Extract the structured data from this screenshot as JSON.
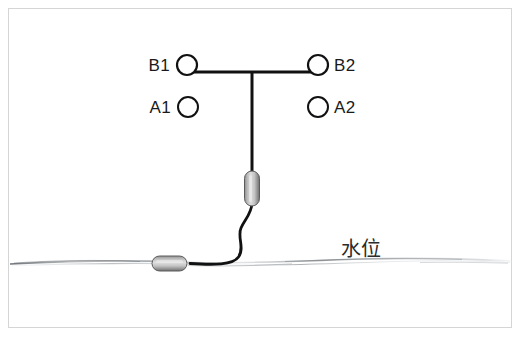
{
  "figure": {
    "frame": {
      "border_color": "#d5d5d5",
      "background": "#ffffff"
    },
    "colors": {
      "line": "#111111",
      "text": "#1a1a1a",
      "waterline": "#6e7176",
      "capsule_light": "#d9d9d9",
      "capsule_mid": "#a8a8a8",
      "capsule_dark": "#6f6f6f"
    },
    "terminals": [
      {
        "id": "B1",
        "label": "B1",
        "label_side": "left",
        "cx": 187,
        "cy": 65,
        "r": 10,
        "connected": true
      },
      {
        "id": "B2",
        "label": "B2",
        "label_side": "right",
        "cx": 318,
        "cy": 65,
        "r": 10,
        "connected": true
      },
      {
        "id": "A1",
        "label": "A1",
        "label_side": "left",
        "cx": 188,
        "cy": 107,
        "r": 10,
        "connected": false
      },
      {
        "id": "A2",
        "label": "A2",
        "label_side": "right",
        "cx": 318,
        "cy": 107,
        "r": 10,
        "connected": false
      }
    ],
    "bus": {
      "horizontal_y": 72,
      "x_start": 187,
      "x_end": 318,
      "drop_x": 252,
      "drop_y_end": 171
    },
    "sensor_upper": {
      "name": "vertical-capsule-sensor",
      "x": 245,
      "y": 171,
      "width": 15,
      "height": 35,
      "orientation": "vertical"
    },
    "sensor_lower": {
      "name": "horizontal-capsule-sensor",
      "x": 152,
      "y": 256,
      "width": 35,
      "height": 15,
      "orientation": "horizontal"
    },
    "cable": {
      "name": "s-curve-cable",
      "path": "M252,206 C251,216 244,220 240,229 C236,238 244,248 238,258 C233,266 216,265 190,263"
    },
    "waterline": {
      "label": "水位",
      "label_x": 341,
      "label_y": 255,
      "y": 262,
      "x_start": 8,
      "x_end": 512
    }
  }
}
